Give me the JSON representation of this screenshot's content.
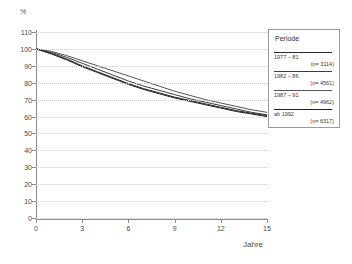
{
  "chart_data": {
    "type": "line",
    "title": "",
    "xlabel": "Jahre",
    "ylabel": "%",
    "xlim": [
      0,
      15
    ],
    "ylim": [
      0,
      110
    ],
    "grid": true,
    "legend_position": "right",
    "legend_title": "Periode",
    "x_ticks": [
      "0",
      "3",
      "6",
      "9",
      "12",
      "15"
    ],
    "x_tick_values": [
      0,
      3,
      6,
      9,
      12,
      15
    ],
    "y_ticks": [
      "0",
      "10",
      "20",
      "30",
      "40",
      "50",
      "60",
      "70",
      "80",
      "90",
      "100",
      "110"
    ],
    "y_tick_values": [
      0,
      10,
      20,
      30,
      40,
      50,
      60,
      70,
      80,
      90,
      100,
      110
    ],
    "x": [
      0,
      1,
      2,
      3,
      4,
      5,
      6,
      7,
      8,
      9,
      10,
      11,
      12,
      13,
      14,
      15
    ],
    "series": [
      {
        "name": "1977 – 81",
        "n_label": "(n= 3114)",
        "color": "#2b2b2b",
        "values": [
          100,
          97.5,
          94.0,
          90.0,
          86.5,
          83.0,
          79.5,
          76.5,
          74.0,
          71.5,
          69.5,
          67.5,
          65.5,
          63.5,
          62.0,
          60.5
        ]
      },
      {
        "name": "1982 – 86",
        "n_label": "(n= 4561)",
        "color": "#3d3d3d",
        "values": [
          100,
          98.0,
          95.0,
          91.5,
          88.0,
          84.5,
          81.0,
          78.0,
          75.5,
          73.0,
          70.5,
          68.5,
          66.5,
          64.5,
          62.5,
          61.0
        ]
      },
      {
        "name": "1987 – 91",
        "n_label": "(n= 4962)",
        "color": "#555555",
        "values": [
          100,
          98.5,
          96.0,
          93.0,
          90.0,
          87.0,
          84.0,
          81.0,
          78.0,
          75.0,
          72.5,
          70.0,
          68.0,
          66.0,
          64.0,
          62.5
        ]
      },
      {
        "name": "ab 1992",
        "n_label": "(n= 6317)",
        "color": "#1f1f1f",
        "values": [
          100,
          97.0,
          93.5,
          89.5,
          86.0,
          82.5,
          79.0,
          76.0,
          73.5,
          71.0,
          69.0,
          67.0,
          65.0,
          63.0,
          61.5,
          60.0
        ]
      }
    ]
  }
}
